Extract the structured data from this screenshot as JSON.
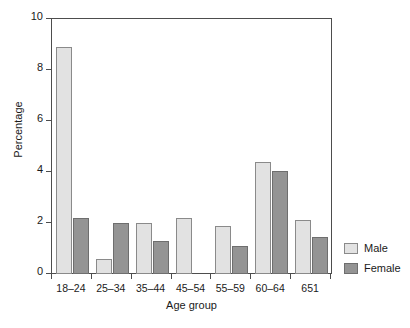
{
  "chart_data": {
    "type": "bar",
    "title": "",
    "xlabel": "Age group",
    "ylabel": "Percentage",
    "categories": [
      "18–24",
      "25–34",
      "35–44",
      "45–54",
      "55–59",
      "60–64",
      "651"
    ],
    "series": [
      {
        "name": "Male",
        "color": "#e2e2e2",
        "values": [
          8.9,
          0.6,
          2.0,
          2.2,
          1.9,
          4.4,
          2.1
        ]
      },
      {
        "name": "Female",
        "color": "#949494",
        "values": [
          2.2,
          2.0,
          1.3,
          null,
          1.1,
          4.05,
          1.45
        ]
      }
    ],
    "ylim": [
      0,
      10
    ],
    "yticks": [
      0,
      2,
      4,
      6,
      8,
      10
    ],
    "ytick_labels": [
      "0",
      "2",
      "4",
      "6",
      "8",
      "10"
    ],
    "grid": false,
    "legend_position": "right"
  },
  "legend": {
    "entries": [
      {
        "label": "Male"
      },
      {
        "label": "Female"
      }
    ]
  },
  "axes": {
    "y_title": "Percentage",
    "x_title": "Age group"
  }
}
